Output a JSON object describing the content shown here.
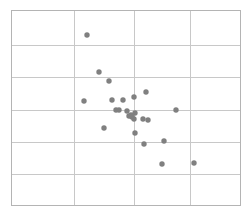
{
  "chart_data": {
    "type": "scatter",
    "title": "",
    "subtitle": "",
    "xlabel": "",
    "ylabel": "",
    "legend": [],
    "annotations": [],
    "grid": true,
    "grid_style": "solid",
    "xtick_labels": [],
    "ytick_labels": [],
    "xlim": [
      0,
      4
    ],
    "ylim": [
      0,
      6
    ],
    "x_gridlines": [
      1,
      2,
      3
    ],
    "y_gridlines": [
      1,
      2,
      3,
      4,
      5
    ],
    "n_points": 25,
    "marker": "circle",
    "marker_color": "#808080",
    "marker_size_px": 5.4,
    "x": [
      1.3,
      1.64,
      1.72,
      1.07,
      1.42,
      1.56,
      1.88,
      2.06,
      1.52,
      1.6,
      1.81,
      1.86,
      1.92,
      2.02,
      1.98,
      2.23,
      2.36,
      1.24,
      2.89,
      2.06,
      2.64,
      3.21,
      2.56,
      3.53,
      1.95
    ],
    "y": [
      5.31,
      4.2,
      3.93,
      3.36,
      3.38,
      3.36,
      3.45,
      3.71,
      3.09,
      3.09,
      3.06,
      2.92,
      2.94,
      2.99,
      2.78,
      2.78,
      2.73,
      2.45,
      3.09,
      2.29,
      2.07,
      1.72,
      1.39,
      1.44,
      2.84
    ],
    "points_px": [
      {
        "cx": 87,
        "cy": 35
      },
      {
        "cx": 99,
        "cy": 72
      },
      {
        "cx": 109,
        "cy": 81
      },
      {
        "cx": 84,
        "cy": 101
      },
      {
        "cx": 112,
        "cy": 100
      },
      {
        "cx": 123,
        "cy": 100
      },
      {
        "cx": 134,
        "cy": 97
      },
      {
        "cx": 146,
        "cy": 92
      },
      {
        "cx": 116,
        "cy": 110
      },
      {
        "cx": 119,
        "cy": 110
      },
      {
        "cx": 127,
        "cy": 111
      },
      {
        "cx": 129,
        "cy": 116
      },
      {
        "cx": 131,
        "cy": 115
      },
      {
        "cx": 135,
        "cy": 113
      },
      {
        "cx": 134,
        "cy": 119
      },
      {
        "cx": 143,
        "cy": 119
      },
      {
        "cx": 148,
        "cy": 120
      },
      {
        "cx": 104,
        "cy": 128
      },
      {
        "cx": 176,
        "cy": 110
      },
      {
        "cx": 135,
        "cy": 133
      },
      {
        "cx": 144,
        "cy": 144
      },
      {
        "cx": 164,
        "cy": 141
      },
      {
        "cx": 162,
        "cy": 164
      },
      {
        "cx": 194,
        "cy": 163
      },
      {
        "cx": 132,
        "cy": 117
      }
    ]
  },
  "plot_geometry": {
    "left_px": 11,
    "right_px": 240,
    "top_px": 10,
    "bottom_px": 205,
    "vertical_gridlines_px": [
      74,
      134,
      190
    ],
    "horizontal_gridlines_px": [
      45,
      77,
      110,
      142,
      174
    ]
  },
  "colors": {
    "background": "#ffffff",
    "border": "#b4b4b4",
    "gridline": "#c8c8c8",
    "marker": "#808080"
  }
}
